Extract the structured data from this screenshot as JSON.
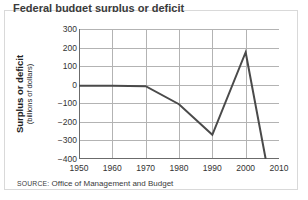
{
  "figure": {
    "clipped_title": "Federal budget surplus or deficit",
    "source_label": "SOURCE:",
    "source_text": "Office of Management and Budget",
    "frame_color": "#d9d9d9"
  },
  "chart_data": {
    "type": "line",
    "title": "",
    "xlabel": "",
    "ylabel": "Surplus or deficit",
    "ylabel_sub": "(billions of dollars)",
    "xlim": [
      1950,
      2010
    ],
    "ylim": [
      -400,
      300
    ],
    "xticks": [
      1950,
      1960,
      1970,
      1980,
      1990,
      2000,
      2010
    ],
    "xticklabels": [
      "1950",
      "1960",
      "1970",
      "1980",
      "1990",
      "2000",
      "2010"
    ],
    "yticks": [
      300,
      200,
      100,
      0,
      -100,
      -200,
      -300,
      -400
    ],
    "yticklabels": [
      "300",
      "200",
      "100",
      "0",
      "−100",
      "−200",
      "−300",
      "−400"
    ],
    "grid": true,
    "legend": "none",
    "series": [
      {
        "name": "Surplus or deficit",
        "color": "#4a4a4a",
        "linewidth": 2,
        "x": [
          1950,
          1960,
          1970,
          1975,
          1980,
          1985,
          1990,
          1992,
          2000,
          2006
        ],
        "values": [
          -3,
          -3,
          -3,
          -53,
          -74,
          -212,
          -221,
          -290,
          236,
          -248
        ]
      }
    ],
    "points": [
      {
        "x": 1950,
        "y": -5
      },
      {
        "x": 1960,
        "y": -5
      },
      {
        "x": 1970,
        "y": -8
      },
      {
        "x": 1980,
        "y": -105
      },
      {
        "x": 1990,
        "y": -270
      },
      {
        "x": 2000,
        "y": 175
      },
      {
        "x": 2006,
        "y": -400
      }
    ],
    "colors": {
      "line": "#4a4a4a",
      "grid": "#b3b3b3",
      "axis": "#6b6b6b",
      "text": "#333333"
    }
  }
}
